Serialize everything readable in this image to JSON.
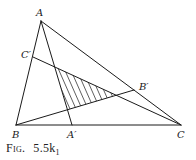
{
  "figure": {
    "caption_prefix": "Fig.",
    "caption_number": "5.5k",
    "caption_subscript": "1"
  },
  "points": {
    "A": {
      "label": "A",
      "x": 41,
      "y": 21
    },
    "B": {
      "label": "B",
      "x": 16,
      "y": 125
    },
    "C": {
      "label": "C",
      "x": 181,
      "y": 125
    },
    "A_prime": {
      "label": "A′",
      "x": 72,
      "y": 125
    },
    "B_prime": {
      "label": "B′",
      "x": 134,
      "y": 90
    },
    "C_prime": {
      "label": "C′",
      "x": 33,
      "y": 57
    }
  },
  "shaded_triangle": {
    "vertices": [
      [
        55,
        67
      ],
      [
        67.5,
        109.7
      ],
      [
        116.3,
        95.2
      ]
    ],
    "fill": "hatched"
  },
  "colors": {
    "ink": "#1a1a1a",
    "background": "#ffffff"
  }
}
